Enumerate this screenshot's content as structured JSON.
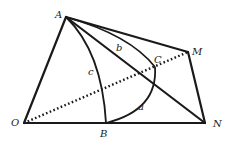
{
  "diagram": {
    "type": "geometry-figure",
    "points": {
      "A": {
        "label": "A",
        "x": 66,
        "y": 17
      },
      "M": {
        "label": "M",
        "x": 188,
        "y": 52
      },
      "N": {
        "label": "N",
        "x": 205,
        "y": 123
      },
      "O": {
        "label": "O",
        "x": 24,
        "y": 123
      },
      "B": {
        "label": "B",
        "x": 106,
        "y": 123
      },
      "C": {
        "label": "C",
        "x": 155,
        "y": 67
      }
    },
    "arc_labels": {
      "a": "a",
      "b": "b",
      "c": "c"
    },
    "segments": [
      {
        "from": "A",
        "to": "O",
        "style": "solid"
      },
      {
        "from": "A",
        "to": "M",
        "style": "solid"
      },
      {
        "from": "A",
        "to": "N",
        "style": "solid"
      },
      {
        "from": "M",
        "to": "N",
        "style": "solid"
      },
      {
        "from": "O",
        "to": "N",
        "style": "solid"
      },
      {
        "from": "O",
        "to": "M",
        "style": "dotted"
      }
    ],
    "arcs": [
      {
        "name": "c",
        "from": "A",
        "to": "B"
      },
      {
        "name": "b",
        "from": "A",
        "to": "C"
      },
      {
        "name": "a",
        "from": "B",
        "to": "C"
      }
    ]
  }
}
